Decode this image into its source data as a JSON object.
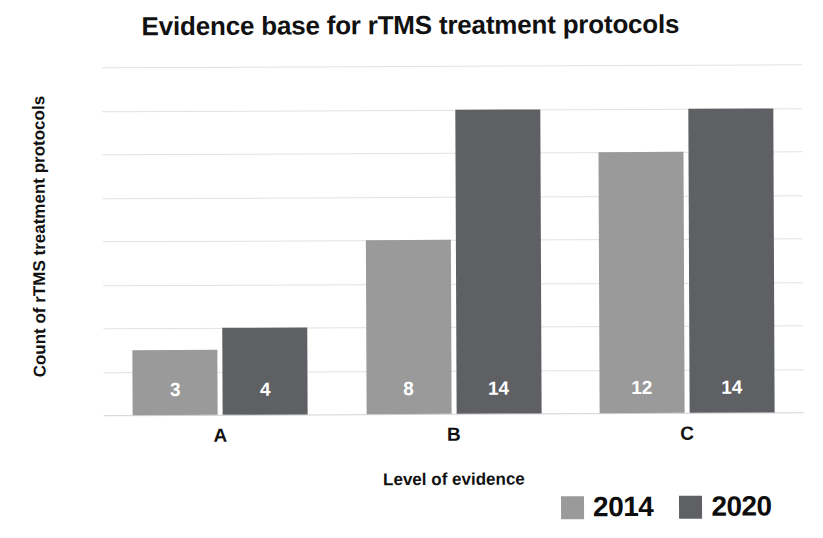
{
  "chart_data": {
    "type": "bar",
    "title": "Evidence base for rTMS treatment protocols",
    "xlabel": "Level of evidence",
    "ylabel": "Count of rTMS treatment protocols",
    "categories": [
      "A",
      "B",
      "C"
    ],
    "series": [
      {
        "name": "2014",
        "color": "#9a9a9a",
        "values": [
          3,
          8,
          12
        ]
      },
      {
        "name": "2020",
        "color": "#5f6063",
        "values": [
          4,
          14,
          14
        ]
      }
    ],
    "ylim": [
      0,
      16
    ],
    "ytick_step": 2,
    "yticks": [
      16,
      14,
      12,
      10,
      8,
      6,
      4,
      2,
      0
    ],
    "grid": true,
    "legend_position": "bottom-right",
    "data_labels": true,
    "data_label_color": "#ffffff"
  },
  "legend": {
    "items": [
      {
        "label": "2014",
        "color": "#9a9a9a"
      },
      {
        "label": "2020",
        "color": "#5f6063"
      }
    ]
  }
}
